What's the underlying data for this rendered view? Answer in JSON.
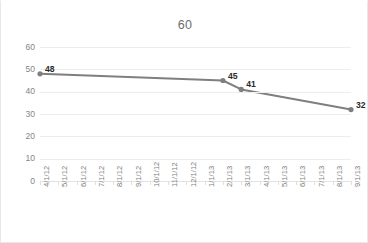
{
  "chart_data": {
    "type": "line",
    "title": "60",
    "xlabel": "",
    "ylabel": "",
    "categories": [
      "4/1/12",
      "5/1/12",
      "6/1/12",
      "7/1/12",
      "8/1/12",
      "9/1/12",
      "10/1/12",
      "11/1/12",
      "12/1/12",
      "1/1/13",
      "2/1/13",
      "3/1/13",
      "4/1/13",
      "5/1/13",
      "6/1/13",
      "7/1/13",
      "8/1/13",
      "9/1/13"
    ],
    "ylim": [
      0,
      60
    ],
    "ytick_labels": [
      "60",
      "50",
      "40",
      "30",
      "20",
      "10",
      "0"
    ],
    "ytick_values": [
      60,
      50,
      40,
      30,
      20,
      10,
      0
    ],
    "grid": true,
    "legend": false,
    "series": [
      {
        "name": "Series1",
        "color": "#7f7f7f",
        "points": [
          {
            "category": "4/1/12",
            "category_index": 0,
            "value": 48,
            "label": "48"
          },
          {
            "category": "2/1/13",
            "category_index": 10,
            "value": 45,
            "label": "45"
          },
          {
            "category": "3/1/13",
            "category_index": 11,
            "value": 41,
            "label": "41"
          },
          {
            "category": "9/1/13",
            "category_index": 17,
            "value": 32,
            "label": "32"
          }
        ]
      }
    ]
  },
  "colors": {
    "series_line": "#7f7f7f",
    "gridline": "#ededed",
    "axis_text": "#858585",
    "title_text": "#6d6d6d",
    "label_text": "#2b2b2b",
    "frame": "#e8e8e8"
  }
}
